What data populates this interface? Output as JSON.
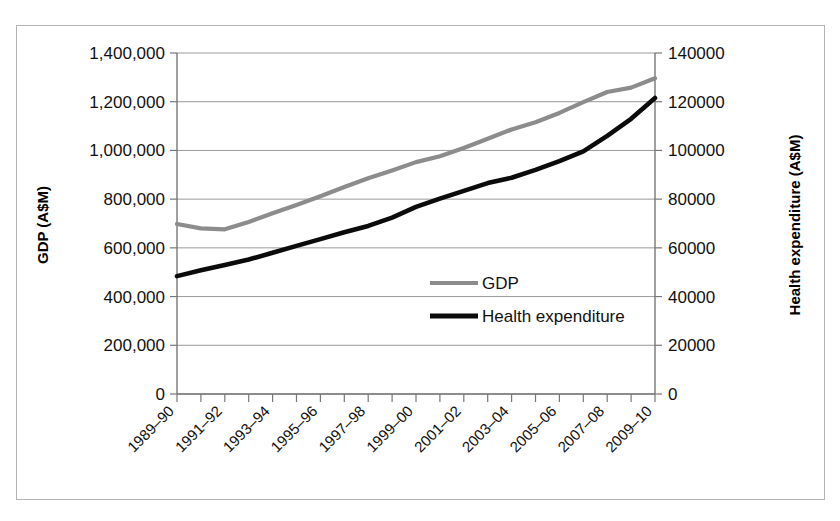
{
  "chart_data": {
    "type": "line",
    "title": "",
    "xlabel": "",
    "categories": [
      "1989–90",
      "1990–91",
      "1991–92",
      "1992–93",
      "1993–94",
      "1994–95",
      "1995–96",
      "1996–97",
      "1997–98",
      "1998–99",
      "1999–00",
      "2000–01",
      "2001–02",
      "2002–03",
      "2003–04",
      "2004–05",
      "2005–06",
      "2006–07",
      "2007–08",
      "2008–09",
      "2009–10"
    ],
    "visible_tick_labels": [
      "1989–90",
      "1991–92",
      "1993–94",
      "1995–96",
      "1997–98",
      "1999–00",
      "2001–02",
      "2003–04",
      "2005–06",
      "2007–08",
      "2009–10"
    ],
    "series": [
      {
        "name": "GDP",
        "axis": "left",
        "color": "#8c8c8c",
        "values": [
          698000,
          680000,
          676000,
          706000,
          742000,
          776000,
          812000,
          850000,
          886000,
          918000,
          952000,
          976000,
          1010000,
          1048000,
          1086000,
          1116000,
          1154000,
          1198000,
          1240000,
          1258000,
          1296000
        ]
      },
      {
        "name": "Health expenditure",
        "axis": "right",
        "color": "#0b0b0b",
        "values": [
          48400,
          50800,
          53000,
          55200,
          58000,
          60800,
          63600,
          66400,
          69000,
          72400,
          76800,
          80200,
          83400,
          86600,
          88800,
          92000,
          95600,
          99600,
          106000,
          113000,
          121500
        ]
      }
    ],
    "left_axis": {
      "label": "GDP (A$M)",
      "ticks": [
        "0",
        "200,000",
        "400,000",
        "600,000",
        "800,000",
        "1,000,000",
        "1,200,000",
        "1,400,000"
      ],
      "min": 0,
      "max": 1400000,
      "step": 200000
    },
    "right_axis": {
      "label": "Health expenditure (A$M)",
      "ticks": [
        "0",
        "20000",
        "40000",
        "60000",
        "80000",
        "100000",
        "120000",
        "140000"
      ],
      "min": 0,
      "max": 140000,
      "step": 20000
    },
    "legend": {
      "position": "inside-center",
      "entries": [
        {
          "label": "GDP",
          "color": "#8c8c8c"
        },
        {
          "label": "Health expenditure",
          "color": "#0b0b0b"
        }
      ]
    },
    "grid": true
  }
}
